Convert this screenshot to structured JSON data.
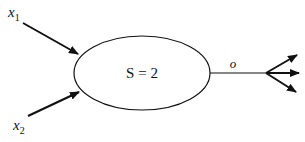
{
  "diagram": {
    "inputs": [
      {
        "name": "x",
        "subscript": "1"
      },
      {
        "name": "x",
        "subscript": "2"
      }
    ],
    "node": {
      "label": "S = 2"
    },
    "output": {
      "label": "o",
      "branches": 3
    }
  }
}
